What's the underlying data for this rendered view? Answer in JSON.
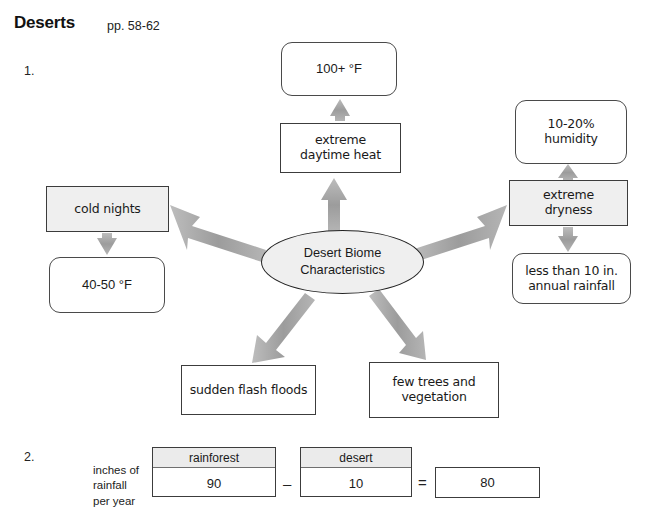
{
  "header": {
    "title": "Deserts",
    "pages": "pp. 58-62"
  },
  "questions": {
    "one": "1.",
    "two": "2."
  },
  "diagram": {
    "center": {
      "line1": "Desert Biome",
      "line2": "Characteristics"
    },
    "nodes": {
      "hot_temp": "100+ °F",
      "extreme_heat_line1": "extreme",
      "extreme_heat_line2": "daytime heat",
      "humidity_line1": "10-20%",
      "humidity_line2": "humidity",
      "extreme_dryness_line1": "extreme",
      "extreme_dryness_line2": "dryness",
      "annual_rainfall_line1": "less than 10 in.",
      "annual_rainfall_line2": "annual rainfall",
      "cold_nights": "cold nights",
      "cold_temp": "40-50 °F",
      "flash_floods": "sudden flash floods",
      "vegetation_line1": "few trees and",
      "vegetation_line2": "vegetation"
    },
    "colors": {
      "arrow": "#9e9e9e",
      "shaded_fill": "#efefef",
      "box_stroke": "#3c3c3c",
      "ellipse_stroke": "#222222"
    }
  },
  "equation": {
    "row_label_line1": "inches of",
    "row_label_line2": "rainfall",
    "row_label_line3": "per year",
    "rainforest_header": "rainforest",
    "rainforest_value": "90",
    "minus_operator": "–",
    "desert_header": "desert",
    "desert_value": "10",
    "equals_operator": "=",
    "result_value": "80"
  }
}
